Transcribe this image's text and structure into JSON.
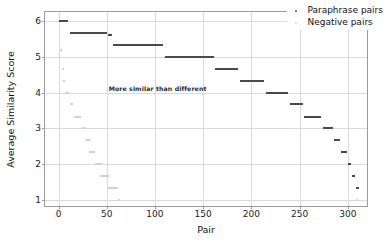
{
  "chart_data": {
    "type": "scatter",
    "title": "",
    "xlabel": "Pair",
    "ylabel": "Average Similarity Score",
    "xlim": [
      -14,
      322
    ],
    "ylim": [
      0.78,
      6.25
    ],
    "xticks": [
      0,
      50,
      100,
      150,
      200,
      250,
      300
    ],
    "yticks": [
      1,
      2,
      3,
      4,
      5,
      6
    ],
    "grid": true,
    "legend_position": "upper right",
    "annotations": [
      {
        "text": "More similar than different",
        "x": 52,
        "y": 4.12
      }
    ],
    "series": [
      {
        "name": "Paraphrase pairs",
        "color": "#4a4a4a",
        "steps": [
          {
            "x_start": 1,
            "x_end": 10,
            "value": 6.0
          },
          {
            "x_start": 12,
            "x_end": 50,
            "value": 5.67
          },
          {
            "x_start": 51,
            "x_end": 56,
            "value": 5.6
          },
          {
            "x_start": 57,
            "x_end": 108,
            "value": 5.33
          },
          {
            "x_start": 110,
            "x_end": 161,
            "value": 5.0
          },
          {
            "x_start": 162,
            "x_end": 186,
            "value": 4.67
          },
          {
            "x_start": 188,
            "x_end": 213,
            "value": 4.33
          },
          {
            "x_start": 215,
            "x_end": 238,
            "value": 4.0
          },
          {
            "x_start": 240,
            "x_end": 254,
            "value": 3.67
          },
          {
            "x_start": 255,
            "x_end": 272,
            "value": 3.33
          },
          {
            "x_start": 274,
            "x_end": 285,
            "value": 3.0
          },
          {
            "x_start": 286,
            "x_end": 292,
            "value": 2.67
          },
          {
            "x_start": 293,
            "x_end": 299,
            "value": 2.33
          },
          {
            "x_start": 300,
            "x_end": 303,
            "value": 2.0
          },
          {
            "x_start": 304,
            "x_end": 308,
            "value": 1.67
          },
          {
            "x_start": 309,
            "x_end": 312,
            "value": 1.33
          }
        ]
      },
      {
        "name": "Negative pairs",
        "color": "#d2d2d2",
        "steps": [
          {
            "x_start": 2,
            "x_end": 4,
            "value": 5.2
          },
          {
            "x_start": 4,
            "x_end": 6,
            "value": 4.67
          },
          {
            "x_start": 5,
            "x_end": 7,
            "value": 4.33
          },
          {
            "x_start": 7,
            "x_end": 11,
            "value": 4.0
          },
          {
            "x_start": 12,
            "x_end": 15,
            "value": 3.67
          },
          {
            "x_start": 16,
            "x_end": 23,
            "value": 3.33
          },
          {
            "x_start": 24,
            "x_end": 28,
            "value": 3.0
          },
          {
            "x_start": 28,
            "x_end": 33,
            "value": 2.67
          },
          {
            "x_start": 32,
            "x_end": 38,
            "value": 2.33
          },
          {
            "x_start": 38,
            "x_end": 45,
            "value": 2.0
          },
          {
            "x_start": 43,
            "x_end": 52,
            "value": 1.67
          },
          {
            "x_start": 50,
            "x_end": 62,
            "value": 1.33
          },
          {
            "x_start": 62,
            "x_end": 64,
            "value": 1.0
          },
          {
            "x_start": 308,
            "x_end": 311,
            "value": 1.0
          }
        ]
      }
    ]
  },
  "legend": {
    "items": [
      {
        "label": "Paraphrase pairs",
        "marker": "dot-dark"
      },
      {
        "label": "Negative pairs",
        "marker": "dot-light"
      }
    ]
  }
}
